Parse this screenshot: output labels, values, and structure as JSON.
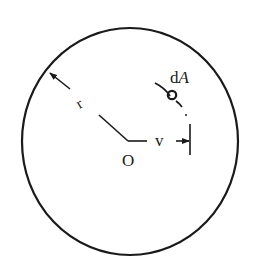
{
  "diagram": {
    "labels": {
      "element": "dA",
      "element_d": "d",
      "element_A": "A",
      "radius": "r",
      "origin": "O",
      "distance": "v"
    },
    "colors": {
      "stroke": "#1a1a1a",
      "background": "#ffffff"
    }
  }
}
